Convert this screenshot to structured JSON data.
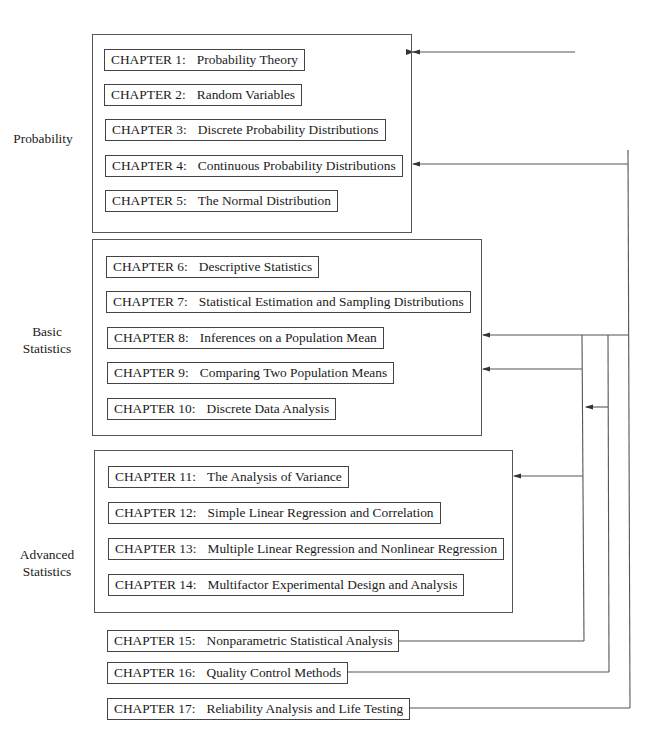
{
  "parts": [
    {
      "label_lines": [
        "Probability"
      ],
      "chapters": [
        {
          "num": "CHAPTER 1:",
          "title": "Probability Theory"
        },
        {
          "num": "CHAPTER 2:",
          "title": "Random Variables"
        },
        {
          "num": "CHAPTER 3:",
          "title": "Discrete Probability Distributions"
        },
        {
          "num": "CHAPTER 4:",
          "title": "Continuous Probability Distributions"
        },
        {
          "num": "CHAPTER 5:",
          "title": "The Normal Distribution"
        }
      ]
    },
    {
      "label_lines": [
        "Basic",
        "Statistics"
      ],
      "chapters": [
        {
          "num": "CHAPTER 6:",
          "title": "Descriptive Statistics"
        },
        {
          "num": "CHAPTER 7:",
          "title": "Statistical Estimation and Sampling Distributions"
        },
        {
          "num": "CHAPTER 8:",
          "title": "Inferences on a Population Mean"
        },
        {
          "num": "CHAPTER 9:",
          "title": "Comparing Two Population Means"
        },
        {
          "num": "CHAPTER 10:",
          "title": "Discrete Data Analysis"
        }
      ]
    },
    {
      "label_lines": [
        "Advanced",
        "Statistics"
      ],
      "chapters": [
        {
          "num": "CHAPTER 11:",
          "title": "The Analysis of Variance"
        },
        {
          "num": "CHAPTER 12:",
          "title": "Simple Linear Regression and Correlation"
        },
        {
          "num": "CHAPTER 13:",
          "title": "Multiple Linear Regression and Nonlinear Regression"
        },
        {
          "num": "CHAPTER 14:",
          "title": "Multifactor Experimental Design and Analysis"
        }
      ]
    }
  ],
  "standalone_chapters": [
    {
      "num": "CHAPTER 15:",
      "title": "Nonparametric Statistical Analysis"
    },
    {
      "num": "CHAPTER 16:",
      "title": "Quality Control Methods"
    },
    {
      "num": "CHAPTER 17:",
      "title": "Reliability Analysis and Life Testing"
    }
  ],
  "colors": {
    "line": "#555555",
    "text": "#1a1a1a",
    "background": "#ffffff"
  }
}
